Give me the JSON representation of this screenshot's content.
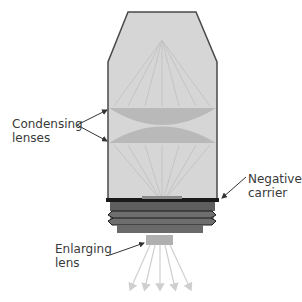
{
  "diagram": {
    "labels": {
      "condensing_line1": "Condensing",
      "condensing_line2": "lenses",
      "negative_line1": "Negative",
      "negative_line2": "carrier",
      "enlarging_line1": "Enlarging",
      "enlarging_line2": "lens"
    },
    "colors": {
      "body_fill": "#d6d6d6",
      "body_stroke": "#4a4a4a",
      "lens_fill": "#b9b9b9",
      "ray_color": "#c8c8c8",
      "carrier_bar": "#1a1a1a",
      "bellows": "#6e6e6e",
      "enlarging_lens": "#b0b0b0"
    }
  }
}
